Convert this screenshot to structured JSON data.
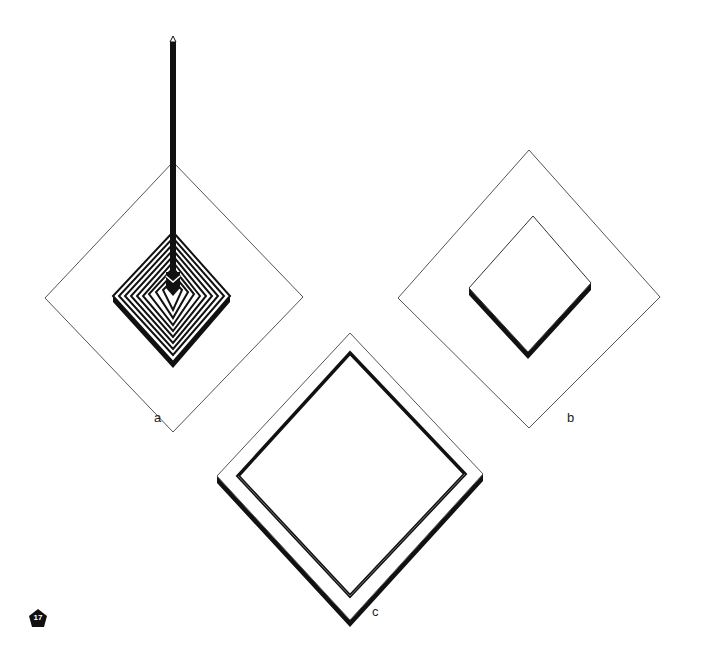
{
  "figure": {
    "number": "17",
    "panels": [
      {
        "id": "a",
        "label": "a",
        "description": "Outer diamond frame with stepped concentric pyramid and vertical pole"
      },
      {
        "id": "b",
        "label": "b",
        "description": "Outer diamond frame with raised inner square slab"
      },
      {
        "id": "c",
        "label": "c",
        "description": "Diamond-shaped frame ring"
      }
    ]
  },
  "colors": {
    "line": "#333333",
    "fill": "#ffffff",
    "shadow": "#111111"
  }
}
